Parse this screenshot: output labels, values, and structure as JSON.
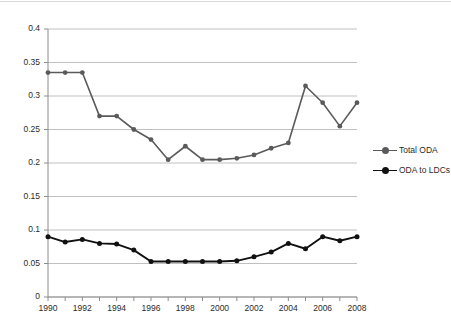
{
  "chart_data": {
    "type": "line",
    "title": "",
    "xlabel": "",
    "ylabel": "",
    "x": [
      1990,
      1991,
      1992,
      1993,
      1994,
      1995,
      1996,
      1997,
      1998,
      1999,
      2000,
      2001,
      2002,
      2003,
      2004,
      2005,
      2006,
      2007,
      2008
    ],
    "xtick_labels": [
      "1990",
      "1992",
      "1994",
      "1996",
      "1998",
      "2000",
      "2002",
      "2004",
      "2006",
      "2008"
    ],
    "xtick_values": [
      1990,
      1992,
      1994,
      1996,
      1998,
      2000,
      2002,
      2004,
      2006,
      2008
    ],
    "ytick_labels": [
      "0",
      "0.05",
      "0.1",
      "0.15",
      "0.2",
      "0.25",
      "0.3",
      "0.35",
      "0.4"
    ],
    "ytick_values": [
      0,
      0.05,
      0.1,
      0.15,
      0.2,
      0.25,
      0.3,
      0.35,
      0.4
    ],
    "ylim": [
      0,
      0.4
    ],
    "xlim": [
      1990,
      2008
    ],
    "grid": "horizontal",
    "legend_position": "right",
    "series": [
      {
        "name": "Total ODA",
        "color": "#5a5a5a",
        "marker": "circle",
        "values": [
          0.335,
          0.335,
          0.335,
          0.27,
          0.27,
          0.25,
          0.235,
          0.205,
          0.225,
          0.205,
          0.205,
          0.207,
          0.212,
          0.222,
          0.23,
          0.315,
          0.29,
          0.255,
          0.29
        ]
      },
      {
        "name": "ODA to LDCs",
        "color": "#111111",
        "marker": "circle",
        "values": [
          0.09,
          0.082,
          0.086,
          0.08,
          0.079,
          0.07,
          0.053,
          0.053,
          0.053,
          0.053,
          0.053,
          0.054,
          0.06,
          0.067,
          0.08,
          0.072,
          0.09,
          0.084,
          0.09
        ]
      }
    ]
  },
  "legend": {
    "items": [
      {
        "label": "Total ODA"
      },
      {
        "label": "ODA to LDCs"
      }
    ]
  }
}
